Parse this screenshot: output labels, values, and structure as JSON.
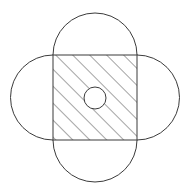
{
  "figure": {
    "title": "Hatched square with four semicircular lobes and central circle",
    "type": "geometric-diagram",
    "canvas": {
      "width": 187,
      "height": 192,
      "background": "#ffffff"
    },
    "stroke": {
      "color": "#3b3b3b",
      "width": 1
    },
    "square": {
      "label": "central-square",
      "x": 53,
      "y": 55,
      "width": 84,
      "height": 85,
      "fill": "none",
      "hatched": true
    },
    "hatch": {
      "label": "diagonal-hatching",
      "angle_deg": 45,
      "direction": "bottom-left-to-top-right",
      "spacing": 12,
      "color": "#4a4a4a",
      "width": 1
    },
    "lobes": [
      {
        "label": "top-lobe",
        "position": "top",
        "radius": 42,
        "cx": 95,
        "cy": 55,
        "extent": 14
      },
      {
        "label": "right-lobe",
        "position": "right",
        "radius": 42.5,
        "cx": 137,
        "cy": 97.5,
        "extent": 175
      },
      {
        "label": "bottom-lobe",
        "position": "bottom",
        "radius": 42,
        "cx": 95,
        "cy": 140,
        "extent": 178
      },
      {
        "label": "left-lobe",
        "position": "left",
        "radius": 42.5,
        "cx": 53,
        "cy": 97.5,
        "extent": 13
      }
    ],
    "center_circle": {
      "label": "center-circle",
      "cx": 95,
      "cy": 98,
      "r": 11,
      "fill": "#ffffff",
      "stroke": "#3b3b3b"
    }
  }
}
